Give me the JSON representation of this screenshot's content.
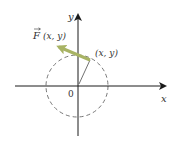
{
  "diagram": {
    "type": "vector-field-diagram",
    "axes": {
      "x_label": "x",
      "y_label": "y",
      "origin_label": "0"
    },
    "circle": {
      "style": "dashed"
    },
    "point_label": "(x, y)",
    "vector_label": "F (x, y)",
    "vector_symbol": "F",
    "vector_args": "(x, y)",
    "colors": {
      "axes": "#1a1a1a",
      "circle": "#555555",
      "vector": "#a8b364",
      "text": "#333333"
    }
  }
}
